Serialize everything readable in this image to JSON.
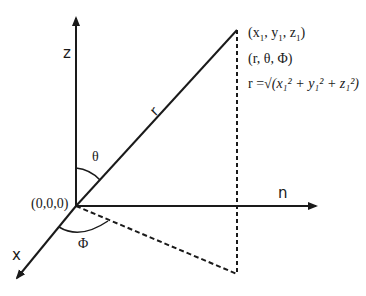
{
  "diagram": {
    "axes": {
      "z_label": "z",
      "x_label": "x",
      "n_label": "n"
    },
    "origin_label": "(0,0,0)",
    "radius_label": "r",
    "angles": {
      "theta": "θ",
      "phi": "Φ"
    },
    "point": {
      "cartesian": "(x₁, y₁, z₁)",
      "cartesian_parts": [
        "(x",
        "1",
        ", y",
        "1",
        ", z",
        "1",
        ")"
      ],
      "spherical": "(r, θ, Φ)",
      "formula_lhs": "r =",
      "formula_rhs": "√(x₁² + y₁² + z₁²)"
    },
    "colors": {
      "line": "#1a1a1a",
      "background": "#ffffff"
    }
  }
}
